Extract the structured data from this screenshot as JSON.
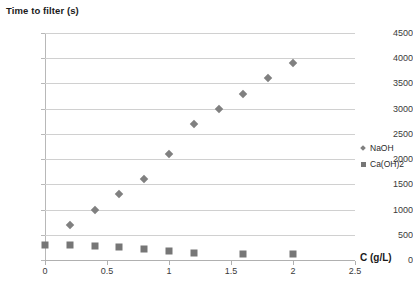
{
  "chart_data": {
    "type": "scatter",
    "title": "Time to filter (s)",
    "xlabel": "C (g/L)",
    "ylabel": "Time to filter (s)",
    "xlim": [
      0,
      2.5
    ],
    "ylim": [
      0,
      4500
    ],
    "xticks": [
      "0",
      "0.5",
      "1",
      "1.5",
      "2",
      "2.5"
    ],
    "xtick_values": [
      0,
      0.5,
      1,
      1.5,
      2,
      2.5
    ],
    "yticks": [
      "0",
      "500",
      "1000",
      "1500",
      "2000",
      "2500",
      "3000",
      "3500",
      "4000",
      "4500"
    ],
    "ytick_values": [
      0,
      500,
      1000,
      1500,
      2000,
      2500,
      3000,
      3500,
      4000,
      4500
    ],
    "grid": "horizontal",
    "legend_position": "right",
    "series": [
      {
        "name": "NaOH",
        "marker": "diamond",
        "color": "#808080",
        "points": [
          [
            0.2,
            700
          ],
          [
            0.4,
            1000
          ],
          [
            0.6,
            1300
          ],
          [
            0.8,
            1600
          ],
          [
            1.0,
            2100
          ],
          [
            1.2,
            2700
          ],
          [
            1.4,
            3000
          ],
          [
            1.6,
            3300
          ],
          [
            1.8,
            3600
          ],
          [
            2.0,
            3900
          ]
        ]
      },
      {
        "name": "Ca(OH)2",
        "marker": "square",
        "color": "#767676",
        "points": [
          [
            0.0,
            300
          ],
          [
            0.2,
            290
          ],
          [
            0.4,
            270
          ],
          [
            0.6,
            250
          ],
          [
            0.8,
            220
          ],
          [
            1.0,
            180
          ],
          [
            1.2,
            140
          ],
          [
            1.6,
            110
          ],
          [
            2.0,
            110
          ]
        ]
      }
    ]
  }
}
